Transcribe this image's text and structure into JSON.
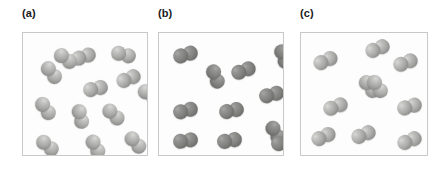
{
  "figure": {
    "width": 447,
    "height": 172,
    "background": "#ffffff"
  },
  "panels": [
    {
      "id": "panel-a",
      "label": "(a)",
      "label_x": 22,
      "label_y": 6,
      "box": {
        "x": 22,
        "y": 32,
        "width": 126,
        "height": 124
      },
      "atom_style": "light",
      "atom_diameter": 15,
      "molecule_count": 13,
      "molecules": [
        {
          "x": 48,
          "y": 16,
          "angle": -18
        },
        {
          "x": 16,
          "y": 32,
          "angle": 52
        },
        {
          "x": 93,
          "y": 38,
          "angle": -22
        },
        {
          "x": 60,
          "y": 48,
          "angle": -12
        },
        {
          "x": 114,
          "y": 54,
          "angle": 34
        },
        {
          "x": 10,
          "y": 68,
          "angle": 55
        },
        {
          "x": 45,
          "y": 76,
          "angle": 76
        },
        {
          "x": 78,
          "y": 74,
          "angle": 44
        },
        {
          "x": 12,
          "y": 105,
          "angle": 40
        },
        {
          "x": 60,
          "y": 106,
          "angle": 62
        },
        {
          "x": 100,
          "y": 102,
          "angle": 48
        },
        {
          "x": 30,
          "y": 18,
          "angle": 36
        },
        {
          "x": 88,
          "y": 14,
          "angle": 14
        }
      ]
    },
    {
      "id": "panel-b",
      "label": "(b)",
      "label_x": 158,
      "label_y": 6,
      "box": {
        "x": 158,
        "y": 32,
        "width": 126,
        "height": 124
      },
      "atom_style": "dark",
      "atom_diameter": 15,
      "molecule_count": 11,
      "molecules": [
        {
          "x": 14,
          "y": 14,
          "angle": -16
        },
        {
          "x": 112,
          "y": 16,
          "angle": 70
        },
        {
          "x": 44,
          "y": 36,
          "angle": 68
        },
        {
          "x": 72,
          "y": 30,
          "angle": -20
        },
        {
          "x": 100,
          "y": 54,
          "angle": -14
        },
        {
          "x": 14,
          "y": 70,
          "angle": -14
        },
        {
          "x": 60,
          "y": 70,
          "angle": -12
        },
        {
          "x": 104,
          "y": 92,
          "angle": 60
        },
        {
          "x": 14,
          "y": 100,
          "angle": -8
        },
        {
          "x": 58,
          "y": 100,
          "angle": -10
        },
        {
          "x": 112,
          "y": 102,
          "angle": -12
        }
      ]
    },
    {
      "id": "panel-c",
      "label": "(c)",
      "label_x": 300,
      "label_y": 6,
      "box": {
        "x": 300,
        "y": 32,
        "width": 128,
        "height": 124
      },
      "atom_style": "light",
      "atom_diameter": 15,
      "molecule_count": 10,
      "molecules": [
        {
          "x": 12,
          "y": 20,
          "angle": -24
        },
        {
          "x": 64,
          "y": 8,
          "angle": -22
        },
        {
          "x": 92,
          "y": 22,
          "angle": -20
        },
        {
          "x": 56,
          "y": 46,
          "angle": 52
        },
        {
          "x": 22,
          "y": 66,
          "angle": -20
        },
        {
          "x": 96,
          "y": 66,
          "angle": -16
        },
        {
          "x": 10,
          "y": 96,
          "angle": -24
        },
        {
          "x": 50,
          "y": 94,
          "angle": -22
        },
        {
          "x": 96,
          "y": 100,
          "angle": -22
        },
        {
          "x": 64,
          "y": 46,
          "angle": 54
        }
      ]
    }
  ]
}
